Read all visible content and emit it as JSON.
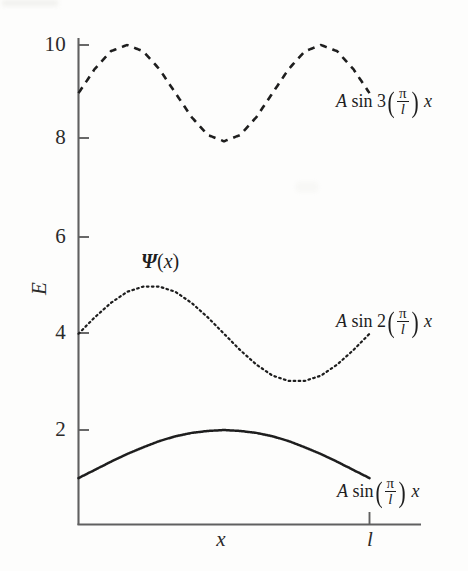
{
  "chart_data": {
    "type": "line",
    "title": "",
    "subtitle": "",
    "xlabel": "x",
    "ylabel": "E",
    "grid": false,
    "legend": "inline-annotations",
    "xlim": [
      0,
      1.15
    ],
    "ylim": [
      0,
      10.6
    ],
    "x_ticks": [
      {
        "label": "l",
        "value": 1.0
      }
    ],
    "y_ticks": [
      {
        "label": "2",
        "value": 2
      },
      {
        "label": "4",
        "value": 4
      },
      {
        "label": "6",
        "value": 6
      },
      {
        "label": "8",
        "value": 8
      },
      {
        "label": "10",
        "value": 10
      }
    ],
    "annotations": [
      {
        "text": "Ψ (x)",
        "x": 0.22,
        "y": 5.55
      }
    ],
    "series": [
      {
        "name": "A sin 3(π/l) x",
        "label_text": "A sin 3(π/l) x",
        "style": "dashed",
        "color": "#1e1e1e",
        "baseline": 9,
        "amplitude": 1,
        "mode": 3,
        "x": [
          0.0,
          0.0556,
          0.1111,
          0.1667,
          0.2222,
          0.2778,
          0.3333,
          0.3889,
          0.4444,
          0.5,
          0.5556,
          0.6111,
          0.6667,
          0.7222,
          0.7778,
          0.8333,
          0.8889,
          0.9444,
          1.0
        ],
        "values": [
          9.0,
          9.5,
          9.87,
          10.0,
          9.87,
          9.5,
          9.0,
          8.5,
          8.13,
          8.0,
          8.13,
          8.5,
          9.0,
          9.5,
          9.87,
          10.0,
          9.87,
          9.5,
          9.0
        ]
      },
      {
        "name": "A sin 2(π/l) x",
        "label_text": "A sin 2(π/l) x",
        "style": "dotted",
        "color": "#1e1e1e",
        "baseline": 4,
        "amplitude": 1,
        "mode": 2,
        "x": [
          0.0,
          0.0556,
          0.1111,
          0.1667,
          0.2222,
          0.2778,
          0.3333,
          0.3889,
          0.4444,
          0.5,
          0.5556,
          0.6111,
          0.6667,
          0.7222,
          0.7778,
          0.8333,
          0.8889,
          0.9444,
          1.0
        ],
        "values": [
          4.0,
          4.34,
          4.64,
          4.87,
          4.98,
          4.98,
          4.87,
          4.64,
          4.34,
          4.0,
          3.66,
          3.36,
          3.13,
          3.02,
          3.02,
          3.13,
          3.36,
          3.66,
          4.0
        ]
      },
      {
        "name": "A sin (π/l) x",
        "label_text": "A sin (π/l) x",
        "style": "solid",
        "color": "#1e1e1e",
        "baseline": 1,
        "amplitude": 1,
        "mode": 1,
        "x": [
          0.0,
          0.0556,
          0.1111,
          0.1667,
          0.2222,
          0.2778,
          0.3333,
          0.3889,
          0.4444,
          0.5,
          0.5556,
          0.6111,
          0.6667,
          0.7222,
          0.7778,
          0.8333,
          0.8889,
          0.9444,
          1.0
        ],
        "values": [
          1.0,
          1.17,
          1.34,
          1.5,
          1.64,
          1.77,
          1.87,
          1.94,
          1.98,
          2.0,
          1.98,
          1.94,
          1.87,
          1.77,
          1.64,
          1.5,
          1.34,
          1.17,
          1.0
        ]
      }
    ]
  },
  "axes": {
    "y_title": "E",
    "x_title": "x",
    "x_end_tick_label": "l"
  },
  "labels": {
    "psi": {
      "symbol": "Ψ",
      "open": "(",
      "variable": "x",
      "close": ")"
    },
    "curve3": {
      "amp": "A",
      "fn": "sin",
      "coeff": "3",
      "num": "π",
      "den": "l",
      "var": "x"
    },
    "curve2": {
      "amp": "A",
      "fn": "sin",
      "coeff": "2",
      "num": "π",
      "den": "l",
      "var": "x"
    },
    "curve1": {
      "amp": "A",
      "fn": "sin",
      "coeff": "",
      "num": "π",
      "den": "l",
      "var": "x"
    }
  },
  "colors": {
    "ink": "#1e1e1e",
    "axis": "#585858",
    "background": "#fdfdfc"
  }
}
